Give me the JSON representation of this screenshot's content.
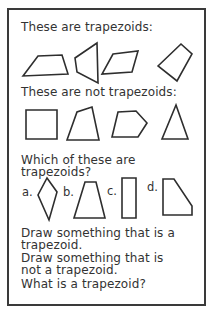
{
  "colors": {
    "ink": "#333333",
    "line": "#2e2e2e",
    "page_border": "#3a3a3a",
    "background": "#ffffff"
  },
  "worksheet": {
    "section_examples": {
      "heading": "These are trapezoids:"
    },
    "section_non_examples": {
      "heading": "These are not trapezoids:"
    },
    "section_which": {
      "heading": "Which of these are trapezoids?"
    },
    "prompts": {
      "draw_trapezoid": "Draw something that is a trapezoid.",
      "draw_not_trapezoid": "Draw something that is not a trapezoid.",
      "define_trapezoid": "What is a trapezoid?"
    }
  },
  "shapes": {
    "trapezoid_examples": [
      {
        "name": "trapezoid-slanted-sides",
        "points": "23,76 38,56 62,55 68,74"
      },
      {
        "name": "sideways-trapezoid",
        "points": "97,43 75,58 77,72 98,83"
      },
      {
        "name": "flat-parallelogram-trapezoid",
        "points": "113,54 138,51 132,72 102,74"
      },
      {
        "name": "rotated-trapezoid",
        "points": "158,66 181,44 192,54 177,81"
      }
    ],
    "non_examples": [
      {
        "name": "square",
        "points": "26,110 57,110 57,139 26,139"
      },
      {
        "name": "irregular-quadrilateral",
        "points": "67,140 77,112 92,107 99,140"
      },
      {
        "name": "pentagon",
        "points": "112,137 118,112 136,111 147,123 138,137"
      },
      {
        "name": "triangle",
        "points": "176,105 162,139 188,139"
      }
    ],
    "options": [
      {
        "label": "a.",
        "name": "kite",
        "points": "47,178 57,192 49,220 38,195"
      },
      {
        "label": "b.",
        "name": "isosceles-trapezoid",
        "points": "85,182 96,182 105,218 74,218"
      },
      {
        "label": "c.",
        "name": "rectangle",
        "points": "122,178 136,178 136,218 122,218"
      },
      {
        "label": "d.",
        "name": "right-trapezoid",
        "points": "163,179 174,179 192,206 192,215 163,215"
      }
    ]
  }
}
